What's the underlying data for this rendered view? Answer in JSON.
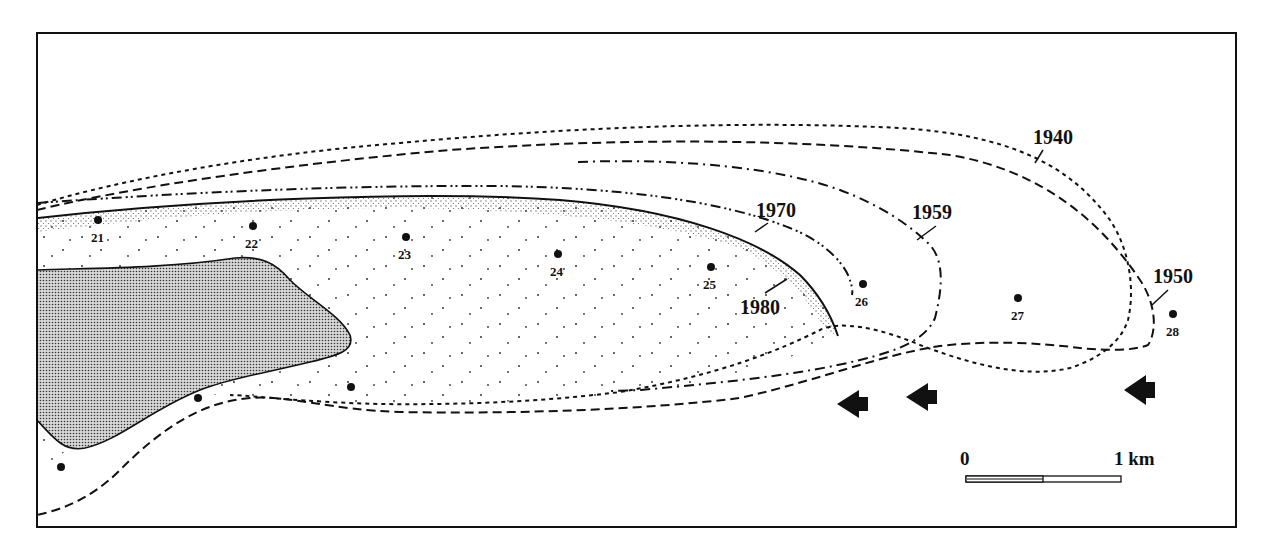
{
  "map": {
    "frame": {
      "x": 37,
      "y": 33,
      "w": 1199,
      "h": 494
    },
    "colors": {
      "ink": "#111111",
      "background": "#ffffff",
      "land_fill": "#bdbdbd"
    },
    "year_labels": [
      {
        "text": "1940",
        "x": 1033,
        "y": 144,
        "leader": [
          1043,
          150,
          1035,
          163
        ]
      },
      {
        "text": "1950",
        "x": 1153,
        "y": 283,
        "leader": [
          1168,
          290,
          1152,
          305
        ]
      },
      {
        "text": "1959",
        "x": 912,
        "y": 219,
        "leader": [
          936,
          226,
          917,
          240
        ]
      },
      {
        "text": "1970",
        "x": 756,
        "y": 217,
        "leader": [
          768,
          223,
          755,
          232
        ]
      },
      {
        "text": "1980",
        "x": 740,
        "y": 314,
        "leader": [
          787,
          279,
          765,
          293
        ]
      }
    ],
    "sites": [
      {
        "id": "21",
        "label": "21",
        "x": 98,
        "y": 220
      },
      {
        "id": "22",
        "label": "22",
        "x": 253,
        "y": 226
      },
      {
        "id": "23",
        "label": "23",
        "x": 406,
        "y": 237
      },
      {
        "id": "24",
        "label": "24",
        "x": 558,
        "y": 254
      },
      {
        "id": "25",
        "label": "25",
        "x": 711,
        "y": 267
      },
      {
        "id": "26",
        "label": "26",
        "x": 863,
        "y": 284
      },
      {
        "id": "27",
        "label": "27",
        "x": 1018,
        "y": 298
      },
      {
        "id": "28",
        "label": "28",
        "x": 1173,
        "y": 314
      },
      {
        "id": "u1",
        "label": "",
        "x": 351,
        "y": 387
      },
      {
        "id": "u2",
        "label": "",
        "x": 198,
        "y": 398
      },
      {
        "id": "u3",
        "label": "",
        "x": 61,
        "y": 467
      }
    ],
    "arrows": [
      {
        "x": 855,
        "y": 404,
        "direction": "west"
      },
      {
        "x": 924,
        "y": 397,
        "direction": "west"
      },
      {
        "x": 1142,
        "y": 390,
        "direction": "west"
      }
    ],
    "scale_bar": {
      "start_label": "0",
      "end_label": "1 km",
      "x": 966,
      "y": 476,
      "width": 155
    }
  }
}
